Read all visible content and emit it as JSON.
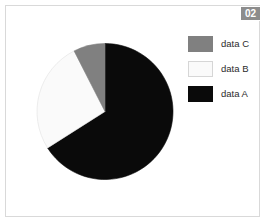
{
  "badge": {
    "label": "02"
  },
  "legend": {
    "position": "right",
    "entries": [
      {
        "label": "data C",
        "color": "#808080",
        "border": "#808080"
      },
      {
        "label": "data B",
        "color": "#fafafa",
        "border": "#d6d6d6"
      },
      {
        "label": "data A",
        "color": "#0a0a0a",
        "border": "#0a0a0a"
      }
    ]
  },
  "chart_data": {
    "type": "pie",
    "title": "",
    "categories": [
      "data A",
      "data B",
      "data C"
    ],
    "values": [
      66,
      26.5,
      7.5
    ],
    "unit": "percent",
    "colors": [
      "#0a0a0a",
      "#fafafa",
      "#808080"
    ],
    "start_angle_deg": 0,
    "direction": "clockwise",
    "legend_entries": [
      "data C",
      "data B",
      "data A"
    ],
    "legend_position": "right",
    "grid": false,
    "xlabel": "",
    "ylabel": "",
    "annotations": [
      "02"
    ]
  },
  "geometry": {
    "center_x": 69,
    "center_y": 69.5,
    "radius": 68
  }
}
